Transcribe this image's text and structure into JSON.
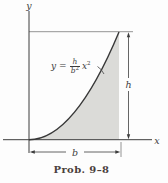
{
  "figure": {
    "caption": "Prob. 9–8",
    "axes": {
      "x_label": "x",
      "y_label": "y"
    },
    "dimensions": {
      "height_label": "h",
      "width_label": "b"
    },
    "equation": {
      "lhs": "y",
      "equals": "=",
      "numerator": "h",
      "denominator_base": "b",
      "denominator_exp": "2",
      "term_base": "x",
      "term_exp": "2"
    },
    "colors": {
      "shade_fill": "#dbdbd8",
      "main_line": "#3d3d3d",
      "extension_line": "#7a7a7a",
      "caption_text": "#4a403c"
    }
  }
}
